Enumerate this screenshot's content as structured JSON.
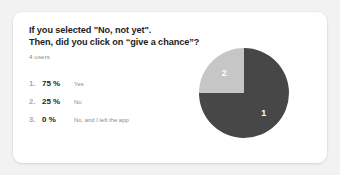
{
  "card": {
    "question_lines": [
      "If you selected \"No, not yet\".",
      "Then, did you click on “give a chance”?"
    ],
    "respondent_count": "4 users"
  },
  "results": [
    {
      "rank": "1.",
      "percent": "75 %",
      "label": "Yes"
    },
    {
      "rank": "2.",
      "percent": "25 %",
      "label": "No"
    },
    {
      "rank": "3.",
      "percent": "0 %",
      "label": "No, and I left the app"
    }
  ],
  "colors": {
    "slice_primary": "#474747",
    "slice_secondary": "#c6c6c6",
    "page_background": "#f2f2f2",
    "card_background": "#ffffff",
    "text_primary": "#1d1d1d",
    "text_muted": "#8a8a8a",
    "rank_muted": "#a9a9a9"
  },
  "chart_data": {
    "type": "pie",
    "title": "",
    "categories": [
      "Yes",
      "No",
      "No, and I left the app"
    ],
    "values": [
      75,
      25,
      0
    ],
    "value_unit": "%",
    "slice_labels": [
      "1",
      "2"
    ],
    "slice_colors": [
      "#474747",
      "#c6c6c6"
    ],
    "legend_position": "left",
    "grid": false,
    "total_responses": 4,
    "start_angle_deg": 0,
    "direction": "clockwise"
  }
}
